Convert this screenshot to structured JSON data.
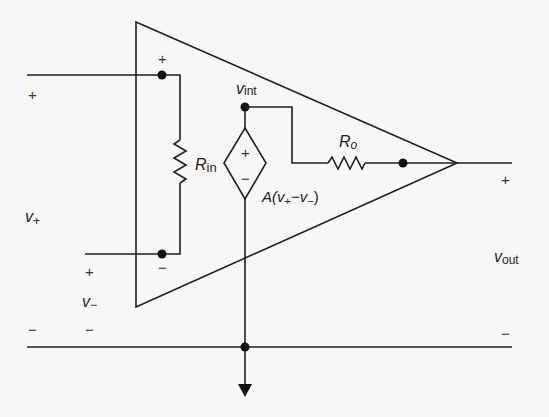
{
  "diagram": {
    "labels": {
      "v_plus": {
        "main": "v",
        "sub": "+"
      },
      "v_minus": {
        "main": "v",
        "sub": "−"
      },
      "v_int": {
        "main": "v",
        "sub": "int"
      },
      "r_in": {
        "main": "R",
        "sub": "in"
      },
      "r_o": {
        "main": "R",
        "sub": "o"
      },
      "source_expr": {
        "a": "A(v",
        "s1": "+",
        "mid": "−v",
        "s2": "−",
        "end": ")"
      },
      "v_out": {
        "main": "v",
        "sub": "out"
      }
    },
    "signs": {
      "input_left_plus": "+",
      "input_left_minus": "−",
      "input_top_node_plus": "+",
      "input_bottom_node_minus": "−",
      "vminus_plus": "+",
      "vminus_minus": "−",
      "source_plus": "+",
      "source_minus": "−",
      "output_plus": "+",
      "output_minus": "−"
    },
    "colors": {
      "line": "#1f1f1f",
      "background": "#f7f7f5"
    }
  }
}
